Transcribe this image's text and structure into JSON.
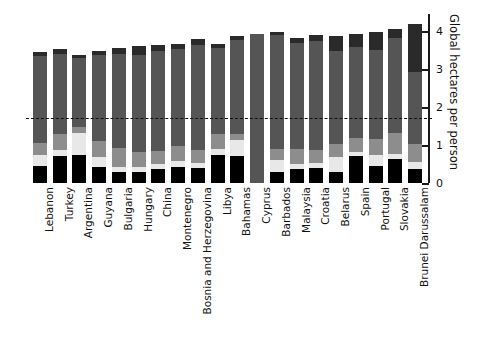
{
  "chart_data": {
    "type": "bar",
    "subtype": "stacked-bar",
    "title": "",
    "xlabel": "",
    "ylabel": "Global hectares per person",
    "ylim": [
      0,
      4.45
    ],
    "yticks": [
      0,
      1,
      2,
      3,
      4
    ],
    "ytick_labels": [
      "0",
      "1",
      "2",
      "3",
      "4"
    ],
    "grid": false,
    "legend": "none",
    "orientation": "vertical",
    "xtick_rotation": -90,
    "annotations": [
      {
        "type": "hline",
        "value": 1.7,
        "style": "dashed",
        "color": "#111111",
        "label": ""
      }
    ],
    "categories": [
      "Lebanon",
      "Turkey",
      "Argentina",
      "Guyana",
      "Bulgaria",
      "Hungary",
      "China",
      "Montenegro",
      "Bosnia and Herzegovina",
      "Libya",
      "Bahamas",
      "Cyprus",
      "Barbados",
      "Malaysia",
      "Croatia",
      "Belarus",
      "Spain",
      "Portugal",
      "Slovakia",
      "Brunei Darussalam"
    ],
    "series": [
      {
        "name": "series-1",
        "color": "#000000",
        "values": [
          0.45,
          0.72,
          0.74,
          0.42,
          0.3,
          0.28,
          0.36,
          0.42,
          0.4,
          0.74,
          0.72,
          0.0,
          0.3,
          0.36,
          0.4,
          0.3,
          0.7,
          0.45,
          0.62,
          0.36
        ]
      },
      {
        "name": "series-2",
        "color": "#e8e8e8",
        "values": [
          0.3,
          0.14,
          0.58,
          0.26,
          0.12,
          0.14,
          0.14,
          0.16,
          0.12,
          0.16,
          0.42,
          0.0,
          0.3,
          0.14,
          0.14,
          0.38,
          0.12,
          0.3,
          0.14,
          0.2
        ]
      },
      {
        "name": "series-3",
        "color": "#8d8d8d",
        "values": [
          0.3,
          0.42,
          0.16,
          0.42,
          0.5,
          0.4,
          0.34,
          0.4,
          0.36,
          0.4,
          0.16,
          0.0,
          0.3,
          0.4,
          0.34,
          0.34,
          0.36,
          0.4,
          0.56,
          0.46
        ]
      },
      {
        "name": "series-4",
        "color": "#555555",
        "values": [
          2.3,
          2.12,
          1.8,
          2.28,
          2.48,
          2.56,
          2.64,
          2.56,
          2.76,
          2.26,
          2.46,
          3.92,
          3.0,
          2.78,
          2.86,
          2.46,
          2.4,
          2.34,
          2.5,
          1.9
        ]
      },
      {
        "name": "series-5",
        "color": "#2a2a2a",
        "values": [
          0.1,
          0.12,
          0.1,
          0.1,
          0.16,
          0.22,
          0.16,
          0.12,
          0.14,
          0.1,
          0.1,
          0.0,
          0.08,
          0.14,
          0.16,
          0.38,
          0.34,
          0.5,
          0.24,
          1.28
        ]
      }
    ],
    "totals": [
      3.45,
      3.52,
      3.38,
      3.48,
      3.56,
      3.6,
      3.64,
      3.66,
      3.78,
      3.66,
      3.86,
      3.92,
      3.98,
      3.82,
      3.9,
      3.86,
      3.92,
      3.99,
      4.06,
      4.2
    ]
  }
}
